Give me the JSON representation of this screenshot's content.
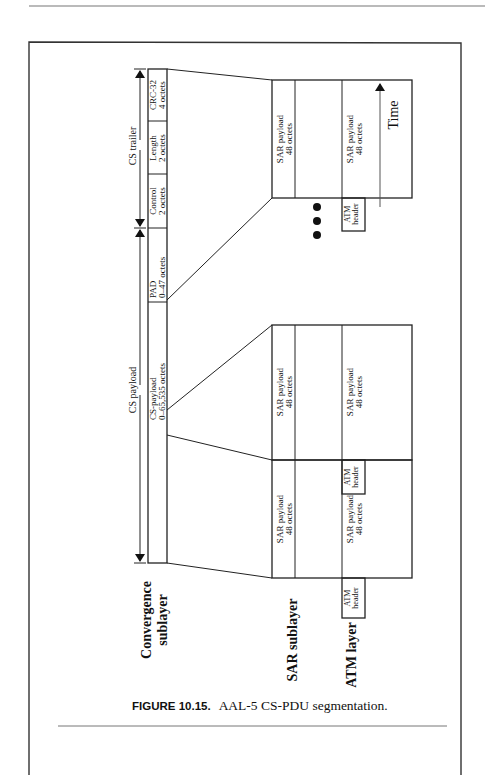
{
  "figure": {
    "caption_label": "FIGURE 10.15.",
    "caption_text": "AAL-5 CS-PDU segmentation.",
    "orientation": "rotated 90 degrees counter-clockwise"
  },
  "layers": {
    "convergence_line1": "Convergence",
    "convergence_line2": "sublayer",
    "sar": "SAR sublayer",
    "atm": "ATM layer"
  },
  "cs_pdu": {
    "span_trailer": "CS trailer",
    "span_payload": "CS payload",
    "fields": [
      {
        "name": "CRC-32",
        "size": "4 octets"
      },
      {
        "name": "Length",
        "size": "2 octets"
      },
      {
        "name": "Control",
        "size": "2 octets"
      },
      {
        "name": "PAD",
        "size": "0–47 octets"
      },
      {
        "name": "CS-payload",
        "size": "0–65,535 octets"
      }
    ]
  },
  "cells": [
    {
      "sar_name": "SAR payload",
      "sar_size": "48 octets",
      "atm_header_line1": "ATM",
      "atm_header_line2": "header",
      "atm_payload_name": "SAR payload",
      "atm_payload_size": "48 octets"
    },
    {
      "sar_name": "SAR payload",
      "sar_size": "48 octets",
      "atm_header_line1": "ATM",
      "atm_header_line2": "header",
      "atm_payload_name": "SAR payload",
      "atm_payload_size": "48 octets"
    },
    {
      "sar_name": "SAR payload",
      "sar_size": "48 octets",
      "atm_header_line1": "ATM",
      "atm_header_line2": "header",
      "atm_payload_name": "SAR payload",
      "atm_payload_size": "48 octets"
    }
  ],
  "ellipsis": "•••",
  "time_axis": {
    "label": "Time"
  }
}
